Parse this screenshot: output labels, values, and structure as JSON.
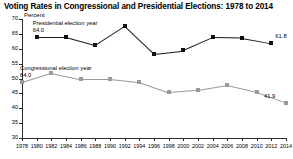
{
  "title": "Voting Rates in Congressional and Presidential Elections: 1978 to 2014",
  "axis_note": "Percent",
  "annotations": {
    "presidential_label": "Presidential election year",
    "presidential_first_value": "64.0",
    "presidential_last_value": "61.8",
    "congressional_label": "Congressional election year",
    "congressional_first_value": "64.0",
    "congressional_last_value": "41.9"
  },
  "colors": {
    "presidential": "#111111",
    "congressional": "#9a9a9a",
    "axis": "#2b2b2b",
    "background": "#ffffff"
  },
  "chart_data": {
    "type": "line",
    "title": "Voting Rates in Congressional and Presidential Elections: 1978 to 2014",
    "xlabel": "",
    "ylabel": "Percent",
    "ylim": [
      30,
      70
    ],
    "yticks": [
      30,
      35,
      40,
      45,
      50,
      55,
      60,
      65,
      70
    ],
    "xlim": [
      1978,
      2014
    ],
    "xticks": [
      1978,
      1980,
      1982,
      1984,
      1986,
      1988,
      1990,
      1992,
      1994,
      1996,
      1998,
      2000,
      2002,
      2004,
      2006,
      2008,
      2010,
      2012,
      2014
    ],
    "grid": false,
    "legend": "annotated-inline",
    "series": [
      {
        "name": "Presidential election year",
        "color": "#111111",
        "x": [
          1980,
          1984,
          1988,
          1992,
          1996,
          2000,
          2004,
          2008,
          2012
        ],
        "values": [
          64.0,
          64.0,
          61.3,
          67.7,
          58.4,
          59.5,
          63.8,
          63.6,
          61.8
        ]
      },
      {
        "name": "Congressional election year",
        "color": "#9a9a9a",
        "x": [
          1978,
          1982,
          1986,
          1990,
          1994,
          1998,
          2002,
          2006,
          2010,
          2014
        ],
        "values": [
          48.9,
          52.0,
          49.9,
          49.9,
          48.8,
          45.3,
          46.1,
          47.8,
          45.5,
          41.9
        ]
      }
    ]
  }
}
